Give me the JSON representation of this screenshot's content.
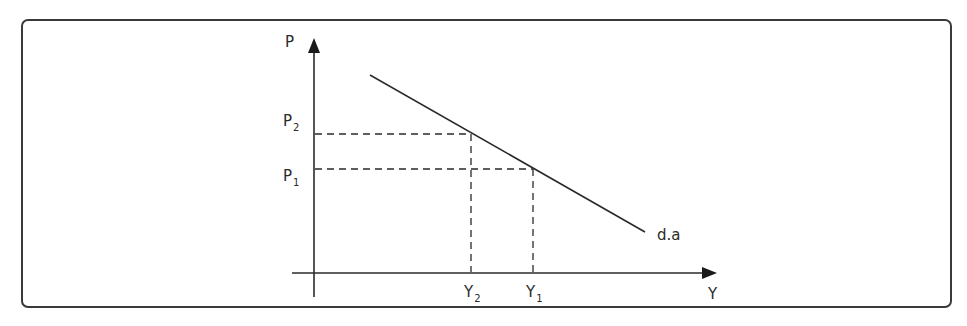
{
  "diagram": {
    "type": "aggregate-demand-curve",
    "axes": {
      "vertical_label": "P",
      "horizontal_label": "Y"
    },
    "price_levels": [
      {
        "base": "P",
        "sub": "2",
        "label": "P2"
      },
      {
        "base": "P",
        "sub": "1",
        "label": "P1"
      }
    ],
    "output_levels": [
      {
        "base": "Y",
        "sub": "2",
        "label": "Y2"
      },
      {
        "base": "Y",
        "sub": "1",
        "label": "Y1"
      }
    ],
    "curve": {
      "label": "d.a",
      "slope": "negative"
    },
    "colors": {
      "line": "#2a2a2a",
      "frame": "#3a3a3a",
      "background": "#ffffff"
    }
  }
}
